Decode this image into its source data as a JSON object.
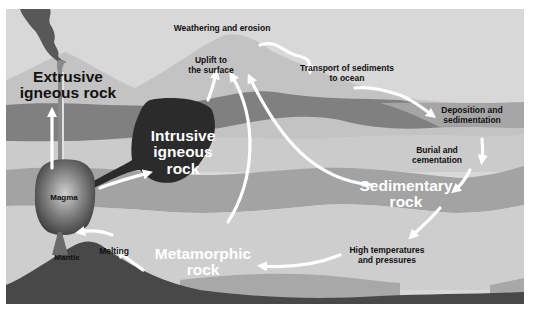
{
  "diagram": {
    "colors": {
      "sky": "#d6d6d6",
      "mountain": "#c4c4c4",
      "band_mid": "#a8a8a8",
      "band_dark": "#7d7d7d",
      "layer_light": "#c9c9c9",
      "deep": "#4a4a4a",
      "arrow": "#ffffff",
      "plume": "#555555"
    },
    "rock_types": {
      "extrusive": "Extrusive igneous rock",
      "extrusive_line1": "Extrusive",
      "extrusive_line2": "igneous rock",
      "intrusive_line1": "Intrusive",
      "intrusive_line2": "igneous",
      "intrusive_line3": "rock",
      "sedimentary_line1": "Sedimentary",
      "sedimentary_line2": "rock",
      "metamorphic_line1": "Metamorphic",
      "metamorphic_line2": "rock"
    },
    "features": {
      "magma": "Magma",
      "mantle": "Mantle"
    },
    "processes": {
      "weathering": "Weathering and erosion",
      "uplift_line1": "Uplift to",
      "uplift_line2": "the surface",
      "transport_line1": "Transport of sediments",
      "transport_line2": "to ocean",
      "deposition_line1": "Deposition and",
      "deposition_line2": "sedimentation",
      "burial_line1": "Burial and",
      "burial_line2": "cementation",
      "high_temp_line1": "High temperatures",
      "high_temp_line2": "and pressures",
      "melting": "Melting"
    }
  }
}
